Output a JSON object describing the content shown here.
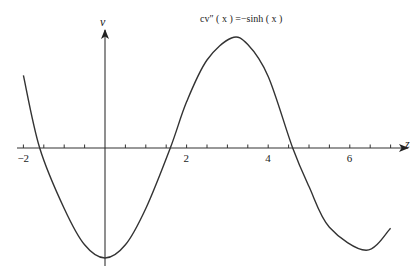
{
  "chart_data": {
    "type": "line",
    "title": "cv″ ( x ) =−sinh ( x )",
    "xlabel": "z",
    "ylabel": "v",
    "x_ticks": [
      -2,
      2,
      4,
      6
    ],
    "x_tick_labels": [
      "−2",
      "2",
      "4",
      "6"
    ],
    "xlim": [
      -2.1,
      7.3
    ],
    "ylim": [
      -1.05,
      1.05
    ],
    "grid": false,
    "legend": null,
    "series": [
      {
        "name": "v(z)",
        "x": [
          -2.0,
          -1.6,
          -1.0,
          -0.5,
          0.0,
          0.5,
          1.0,
          1.6,
          2.0,
          2.5,
          3.1,
          3.5,
          4.0,
          4.6,
          5.0,
          5.5,
          6.4,
          7.0
        ],
        "values": [
          0.66,
          0.0,
          -0.55,
          -0.88,
          -1.0,
          -0.88,
          -0.55,
          0.0,
          0.42,
          0.8,
          1.0,
          0.94,
          0.65,
          0.0,
          -0.35,
          -0.72,
          -0.93,
          -0.73
        ]
      }
    ],
    "colors": {
      "curve": "#333333",
      "axis": "#333333"
    }
  }
}
